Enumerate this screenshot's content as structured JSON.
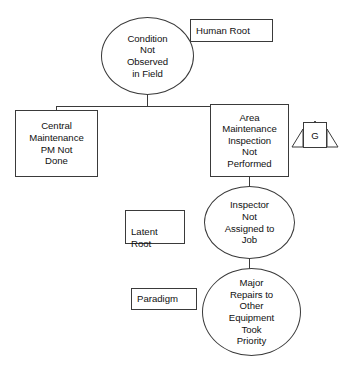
{
  "diagram": {
    "type": "root-cause-tree",
    "background_color": "#ffffff",
    "line_color": "#3a3a3a",
    "text_color": "#111111",
    "nodes": {
      "condition_not_observed": {
        "shape": "ellipse",
        "text": "Condition\nNot\nObserved\nin Field"
      },
      "central_maintenance": {
        "shape": "rectangle",
        "text": "Central\nMaintenance\nPM Not\nDone"
      },
      "area_maintenance": {
        "shape": "rectangle",
        "text": "Area\nMaintenance\nInspection\nNot\nPerformed"
      },
      "inspector_not_assigned": {
        "shape": "ellipse",
        "text": "Inspector\nNot\nAssigned to\nJob"
      },
      "major_repairs": {
        "shape": "ellipse",
        "text": "Major\nRepairs to\nOther\nEquipment\nTook\nPriority"
      }
    },
    "labels": {
      "human_root": "Human Root",
      "latent_root": "Latent\nRoot",
      "paradigm": "Paradigm"
    },
    "symbols": {
      "gate": "G"
    }
  }
}
